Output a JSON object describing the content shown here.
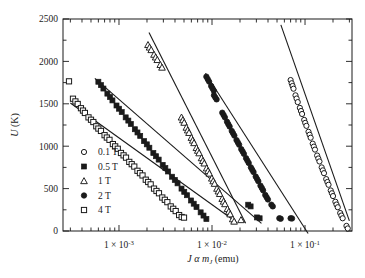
{
  "chart_data": {
    "type": "scatter",
    "title": "",
    "xlabel": "J α m_J (emu)",
    "xlabel_parts": {
      "j": "J",
      "alpha": "α",
      "m": "m",
      "sub": "J",
      "unit": "(emu)"
    },
    "ylabel": "U (K)",
    "xscale": "log",
    "yscale": "linear",
    "xlim": [
      0.00025,
      0.32
    ],
    "ylim": [
      0,
      2500
    ],
    "grid": false,
    "legend_position": "lower left inside",
    "xticks_major": [
      0.001,
      0.01,
      0.1
    ],
    "xticklabels": [
      "1 × 10⁻³",
      "1 × 10⁻²",
      "1 × 10⁻¹"
    ],
    "xtick_exponents": [
      "-3",
      "-2",
      "-1"
    ],
    "yticks_major": [
      0,
      500,
      1000,
      1500,
      2000,
      2500
    ],
    "yticklabels": [
      "0",
      "500",
      "1000",
      "1500",
      "2000",
      "2500"
    ],
    "yticks_minor": [
      250,
      750,
      1250,
      1750,
      2250
    ],
    "series": [
      {
        "name": "0.1 T",
        "label": "0.1 T",
        "marker": "open-circle",
        "color": "#1a1a1a",
        "fit_line": {
          "x0": 0.055,
          "y0": 2430,
          "x1": 0.3,
          "y1": 120
        },
        "points": [
          [
            0.07,
            1780
          ],
          [
            0.0718,
            1742
          ],
          [
            0.0735,
            1710
          ],
          [
            0.0752,
            1678
          ],
          [
            0.079,
            1600
          ],
          [
            0.0812,
            1562
          ],
          [
            0.0835,
            1520
          ],
          [
            0.088,
            1452
          ],
          [
            0.0905,
            1415
          ],
          [
            0.093,
            1380
          ],
          [
            0.098,
            1310
          ],
          [
            0.1005,
            1275
          ],
          [
            0.1035,
            1240
          ],
          [
            0.109,
            1170
          ],
          [
            0.112,
            1135
          ],
          [
            0.115,
            1100
          ],
          [
            0.121,
            1030
          ],
          [
            0.1245,
            995
          ],
          [
            0.128,
            960
          ],
          [
            0.135,
            890
          ],
          [
            0.139,
            855
          ],
          [
            0.143,
            820
          ],
          [
            0.151,
            750
          ],
          [
            0.1555,
            715
          ],
          [
            0.16,
            682
          ],
          [
            0.169,
            612
          ],
          [
            0.174,
            578
          ],
          [
            0.179,
            545
          ],
          [
            0.189,
            478
          ],
          [
            0.1945,
            445
          ],
          [
            0.2,
            412
          ],
          [
            0.212,
            345
          ],
          [
            0.218,
            312
          ],
          [
            0.225,
            280
          ],
          [
            0.239,
            212
          ],
          [
            0.246,
            182
          ],
          [
            0.254,
            150
          ],
          [
            0.279,
            60
          ],
          [
            0.288,
            30
          ]
        ]
      },
      {
        "name": "0.5 T",
        "label": "0.5 T",
        "marker": "filled-square",
        "color": "#1a1a1a",
        "fit_line": {
          "x0": 0.00055,
          "y0": 1800,
          "x1": 0.034,
          "y1": 90
        },
        "points": [
          [
            0.0006,
            1760
          ],
          [
            0.00064,
            1720
          ],
          [
            0.00068,
            1680
          ],
          [
            0.00075,
            1620
          ],
          [
            0.0008,
            1580
          ],
          [
            0.00085,
            1540
          ],
          [
            0.00094,
            1480
          ],
          [
            0.001,
            1442
          ],
          [
            0.00107,
            1402
          ],
          [
            0.00118,
            1340
          ],
          [
            0.00126,
            1302
          ],
          [
            0.00134,
            1262
          ],
          [
            0.00148,
            1200
          ],
          [
            0.00158,
            1162
          ],
          [
            0.00169,
            1122
          ],
          [
            0.00186,
            1060
          ],
          [
            0.00199,
            1022
          ],
          [
            0.00212,
            982
          ],
          [
            0.00234,
            920
          ],
          [
            0.0025,
            882
          ],
          [
            0.00267,
            842
          ],
          [
            0.00295,
            780
          ],
          [
            0.00315,
            742
          ],
          [
            0.00337,
            702
          ],
          [
            0.00372,
            640
          ],
          [
            0.00398,
            602
          ],
          [
            0.00426,
            562
          ],
          [
            0.0047,
            500
          ],
          [
            0.00503,
            462
          ],
          [
            0.00538,
            422
          ],
          [
            0.00595,
            360
          ],
          [
            0.00636,
            322
          ],
          [
            0.00681,
            282
          ],
          [
            0.00755,
            220
          ],
          [
            0.0081,
            182
          ],
          [
            0.0087,
            142
          ],
          [
            0.0245,
            310
          ],
          [
            0.026,
            290
          ],
          [
            0.0305,
            160
          ],
          [
            0.0325,
            150
          ]
        ]
      },
      {
        "name": "1 T",
        "label": "1 T",
        "marker": "open-triangle",
        "color": "#1a1a1a",
        "fit_line": {
          "x0": 0.0021,
          "y0": 2340,
          "x1": 0.023,
          "y1": 90
        },
        "points": [
          [
            0.00205,
            2195
          ],
          [
            0.00213,
            2165
          ],
          [
            0.00222,
            2135
          ],
          [
            0.00238,
            2080
          ],
          [
            0.00248,
            2048
          ],
          [
            0.00258,
            2018
          ],
          [
            0.00278,
            1960
          ],
          [
            0.0029,
            1928
          ],
          [
            0.0047,
            1340
          ],
          [
            0.00486,
            1308
          ],
          [
            0.00502,
            1278
          ],
          [
            0.0053,
            1220
          ],
          [
            0.00548,
            1188
          ],
          [
            0.00566,
            1158
          ],
          [
            0.006,
            1100
          ],
          [
            0.0062,
            1068
          ],
          [
            0.00641,
            1038
          ],
          [
            0.0068,
            980
          ],
          [
            0.00703,
            948
          ],
          [
            0.00727,
            918
          ],
          [
            0.00772,
            860
          ],
          [
            0.00798,
            828
          ],
          [
            0.00825,
            798
          ],
          [
            0.00876,
            740
          ],
          [
            0.00906,
            708
          ],
          [
            0.00937,
            678
          ],
          [
            0.00996,
            620
          ],
          [
            0.0103,
            588
          ],
          [
            0.01065,
            558
          ],
          [
            0.01132,
            500
          ],
          [
            0.01171,
            468
          ],
          [
            0.01211,
            438
          ],
          [
            0.01288,
            380
          ],
          [
            0.01332,
            348
          ],
          [
            0.01378,
            318
          ],
          [
            0.01466,
            260
          ],
          [
            0.01516,
            228
          ],
          [
            0.01568,
            198
          ],
          [
            0.0167,
            140
          ],
          [
            0.01728,
            112
          ],
          [
            0.0205,
            130
          ]
        ]
      },
      {
        "name": "2 T",
        "label": "2 T",
        "marker": "filled-circle",
        "color": "#1a1a1a",
        "fit_line": {
          "x0": 0.0085,
          "y0": 1860,
          "x1": 0.108,
          "y1": -30
        },
        "points": [
          [
            0.0087,
            1820
          ],
          [
            0.009,
            1790
          ],
          [
            0.0093,
            1762
          ],
          [
            0.0098,
            1710
          ],
          [
            0.01012,
            1682
          ],
          [
            0.01045,
            1655
          ],
          [
            0.0105,
            1600
          ],
          [
            0.01085,
            1575
          ],
          [
            0.0112,
            1552
          ],
          [
            0.0129,
            1395
          ],
          [
            0.01332,
            1368
          ],
          [
            0.01375,
            1340
          ],
          [
            0.0145,
            1288
          ],
          [
            0.01498,
            1260
          ],
          [
            0.01546,
            1232
          ],
          [
            0.0163,
            1180
          ],
          [
            0.01684,
            1152
          ],
          [
            0.01738,
            1125
          ],
          [
            0.01835,
            1072
          ],
          [
            0.01895,
            1045
          ],
          [
            0.01957,
            1018
          ],
          [
            0.02065,
            965
          ],
          [
            0.02133,
            938
          ],
          [
            0.02202,
            910
          ],
          [
            0.02325,
            858
          ],
          [
            0.02402,
            830
          ],
          [
            0.0248,
            802
          ],
          [
            0.0262,
            750
          ],
          [
            0.02706,
            722
          ],
          [
            0.02794,
            695
          ],
          [
            0.0295,
            642
          ],
          [
            0.03047,
            615
          ],
          [
            0.03146,
            588
          ],
          [
            0.0332,
            535
          ],
          [
            0.0343,
            508
          ],
          [
            0.0354,
            480
          ],
          [
            0.0374,
            425
          ],
          [
            0.03864,
            398
          ],
          [
            0.0399,
            372
          ],
          [
            0.0435,
            310
          ],
          [
            0.045,
            290
          ],
          [
            0.053,
            150
          ],
          [
            0.0548,
            145
          ],
          [
            0.07,
            150
          ],
          [
            0.0725,
            148
          ]
        ]
      },
      {
        "name": "4 T",
        "label": "4 T",
        "marker": "open-square",
        "color": "#1a1a1a",
        "fit_line": {
          "x0": 0.0003,
          "y0": 1510,
          "x1": 0.017,
          "y1": 130
        },
        "points": [
          [
            0.00029,
            1765
          ],
          [
            0.00032,
            1560
          ],
          [
            0.00034,
            1528
          ],
          [
            0.00036,
            1498
          ],
          [
            0.00039,
            1448
          ],
          [
            0.00041,
            1420
          ],
          [
            0.00043,
            1392
          ],
          [
            0.00047,
            1340
          ],
          [
            0.0005,
            1312
          ],
          [
            0.00053,
            1285
          ],
          [
            0.00057,
            1235
          ],
          [
            0.0006,
            1208
          ],
          [
            0.00064,
            1180
          ],
          [
            0.0007,
            1130
          ],
          [
            0.00074,
            1102
          ],
          [
            0.00079,
            1075
          ],
          [
            0.00086,
            1025
          ],
          [
            0.00091,
            998
          ],
          [
            0.00097,
            970
          ],
          [
            0.00105,
            920
          ],
          [
            0.00112,
            892
          ],
          [
            0.00119,
            865
          ],
          [
            0.00129,
            815
          ],
          [
            0.00137,
            788
          ],
          [
            0.00146,
            760
          ],
          [
            0.00158,
            710
          ],
          [
            0.00168,
            682
          ],
          [
            0.00179,
            655
          ],
          [
            0.00194,
            605
          ],
          [
            0.00206,
            578
          ],
          [
            0.00219,
            550
          ],
          [
            0.00238,
            500
          ],
          [
            0.00253,
            472
          ],
          [
            0.00269,
            445
          ],
          [
            0.00292,
            395
          ],
          [
            0.00311,
            368
          ],
          [
            0.00331,
            340
          ],
          [
            0.0036,
            290
          ],
          [
            0.00383,
            262
          ],
          [
            0.00407,
            235
          ],
          [
            0.00443,
            188
          ],
          [
            0.00472,
            165
          ],
          [
            0.005,
            158
          ]
        ]
      }
    ]
  },
  "axis": {
    "y_label": "U (K)",
    "y_label_var": "U",
    "y_label_unit": " (K)"
  }
}
